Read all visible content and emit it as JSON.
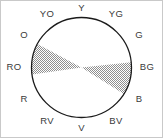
{
  "figure": {
    "kind": "color-wheel-diagram",
    "frame_color": "#c9c9c9",
    "background_color": "#ffffff",
    "circle_outline_color": "#1a1a1a",
    "shade_color": "#a8a8a8",
    "label_color": "#3a3a3a"
  },
  "wheel": {
    "center_x": 81.5,
    "center_y": 67.5,
    "radius": 50,
    "hues": [
      {
        "label": "Y",
        "angle_deg": 90,
        "label_x": 81.5,
        "label_y": 8
      },
      {
        "label": "YG",
        "angle_deg": 60,
        "label_x": 116,
        "label_y": 14
      },
      {
        "label": "G",
        "angle_deg": 30,
        "label_x": 139,
        "label_y": 35
      },
      {
        "label": "BG",
        "angle_deg": 0,
        "label_x": 147,
        "label_y": 67
      },
      {
        "label": "B",
        "angle_deg": -30,
        "label_x": 139,
        "label_y": 99
      },
      {
        "label": "BV",
        "angle_deg": -60,
        "label_x": 116,
        "label_y": 121
      },
      {
        "label": "V",
        "angle_deg": -90,
        "label_x": 81.5,
        "label_y": 128
      },
      {
        "label": "RV",
        "angle_deg": 240,
        "label_x": 47,
        "label_y": 121
      },
      {
        "label": "R",
        "angle_deg": 210,
        "label_x": 24,
        "label_y": 99
      },
      {
        "label": "RO",
        "angle_deg": 180,
        "label_x": 14,
        "label_y": 67
      },
      {
        "label": "O",
        "angle_deg": 150,
        "label_x": 24,
        "label_y": 35
      },
      {
        "label": "YO",
        "angle_deg": 120,
        "label_x": 47,
        "label_y": 14
      }
    ],
    "shaded_wedges": [
      {
        "name": "upper-left-wedge",
        "from_hue": "O",
        "to_hue": "RO",
        "start_angle_deg": 152,
        "end_angle_deg": 188
      },
      {
        "name": "lower-right-wedge",
        "from_hue": "BG",
        "to_hue": "B",
        "start_angle_deg": -32,
        "end_angle_deg": 6
      }
    ]
  }
}
